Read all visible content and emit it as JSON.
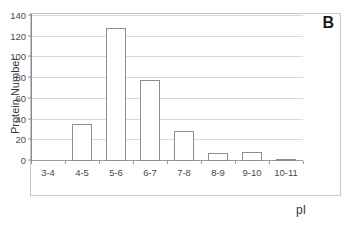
{
  "panel": {
    "label": "B"
  },
  "axes": {
    "y_title": "Protein Number",
    "x_title": "pI"
  },
  "colors": {
    "bar_outline": "#8d8d8d",
    "bar_fill": "#ffffff",
    "gridline": "#d9d9d9",
    "axis_line": "#8a8a8a",
    "frame": "#c8c8c8",
    "text": "#3a3a3a"
  },
  "chart_data": {
    "type": "bar",
    "title": "B",
    "xlabel": "pI",
    "ylabel": "Protein Number",
    "categories": [
      "3-4",
      "4-5",
      "5-6",
      "6-7",
      "7-8",
      "8-9",
      "9-10",
      "10-11"
    ],
    "values": [
      0,
      36,
      128,
      78,
      29,
      8,
      9,
      2
    ],
    "ylim": [
      0,
      140
    ],
    "yticks": [
      0,
      20,
      40,
      60,
      80,
      100,
      120,
      140
    ],
    "ytick_labels": [
      "0",
      "20",
      "40",
      "60",
      "80",
      "100",
      "120",
      "140"
    ],
    "grid": true,
    "grid_axis": "y",
    "legend": false,
    "series": [
      {
        "name": "Protein Number",
        "values": [
          0,
          36,
          128,
          78,
          29,
          8,
          9,
          2
        ]
      }
    ]
  }
}
